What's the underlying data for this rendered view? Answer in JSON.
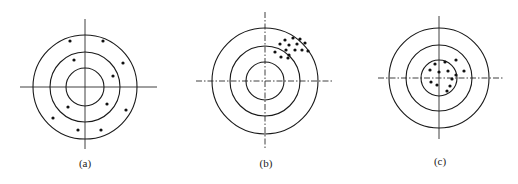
{
  "figure": {
    "panels": [
      {
        "id": "a",
        "label": "(a)",
        "center": [
          85,
          87
        ],
        "ring_radii": [
          19,
          35,
          52
        ],
        "h_axis": [
          20,
          157
        ],
        "v_axis": [
          19,
          149
        ],
        "label_pos": [
          85,
          167
        ],
        "shots": [
          [
            70,
            41
          ],
          [
            103,
            41
          ],
          [
            74,
            60
          ],
          [
            123,
            63
          ],
          [
            113,
            76
          ],
          [
            68,
            107
          ],
          [
            107,
            104
          ],
          [
            126,
            110
          ],
          [
            53,
            118
          ],
          [
            78,
            130
          ],
          [
            101,
            130
          ]
        ]
      },
      {
        "id": "b",
        "label": "(b)",
        "center": [
          265,
          81
        ],
        "ring_radii": [
          19,
          35,
          53
        ],
        "h_axis": [
          196,
          334
        ],
        "v_axis": [
          12,
          148
        ],
        "label_pos": [
          266,
          167
        ],
        "shots": [
          [
            285,
            40
          ],
          [
            293,
            38
          ],
          [
            300,
            39
          ],
          [
            280,
            44
          ],
          [
            289,
            45
          ],
          [
            297,
            44
          ],
          [
            305,
            43
          ],
          [
            286,
            50
          ],
          [
            295,
            50
          ],
          [
            302,
            50
          ],
          [
            275,
            52
          ],
          [
            289,
            55
          ],
          [
            308,
            51
          ],
          [
            281,
            57
          ],
          [
            288,
            58
          ]
        ]
      },
      {
        "id": "c",
        "label": "(c)",
        "center": [
          439,
          78
        ],
        "ring_radii": [
          18,
          33,
          50
        ],
        "h_axis": [
          378,
          503
        ],
        "v_axis": [
          16,
          139
        ],
        "label_pos": [
          440,
          165
        ],
        "shots": [
          [
            435,
            64
          ],
          [
            445,
            62
          ],
          [
            456,
            60
          ],
          [
            430,
            70
          ],
          [
            439,
            72
          ],
          [
            448,
            71
          ],
          [
            464,
            71
          ],
          [
            456,
            75
          ],
          [
            452,
            79
          ],
          [
            431,
            82
          ],
          [
            437,
            85
          ],
          [
            450,
            86
          ],
          [
            447,
            91
          ]
        ]
      }
    ]
  }
}
